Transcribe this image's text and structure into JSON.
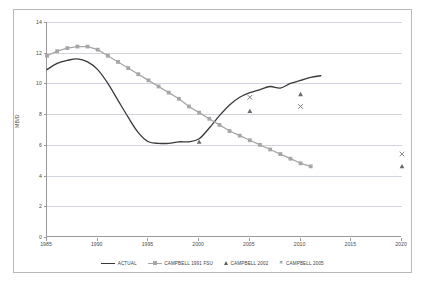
{
  "chart_data": {
    "type": "line",
    "title": "",
    "xlabel": "",
    "ylabel": "MB/D",
    "xlim": [
      1985,
      2020
    ],
    "ylim": [
      0,
      14
    ],
    "xticks": [
      1985,
      1990,
      1995,
      2000,
      2005,
      2010,
      2015,
      2020
    ],
    "yticks": [
      0,
      2,
      4,
      6,
      8,
      10,
      12,
      14
    ],
    "grid": true,
    "legend_position": "bottom",
    "series": [
      {
        "name": "ACTUAL",
        "type": "line",
        "color": "#3a3a3a",
        "marker": "none",
        "x": [
          1985,
          1986,
          1987,
          1988,
          1989,
          1990,
          1991,
          1992,
          1993,
          1994,
          1995,
          1996,
          1997,
          1998,
          1999,
          2000,
          2001,
          2002,
          2003,
          2004,
          2005,
          2006,
          2007,
          2008,
          2009,
          2010,
          2011,
          2012
        ],
        "values": [
          10.9,
          11.3,
          11.5,
          11.6,
          11.4,
          10.9,
          10.0,
          8.9,
          7.8,
          6.8,
          6.2,
          6.1,
          6.1,
          6.2,
          6.2,
          6.4,
          7.1,
          7.9,
          8.6,
          9.1,
          9.4,
          9.6,
          9.8,
          9.7,
          10.0,
          10.2,
          10.4,
          10.5
        ]
      },
      {
        "name": "CAMPBELL 1991 FSU",
        "type": "line",
        "color": "#a6a6a6",
        "marker": "square",
        "x": [
          1985,
          1986,
          1987,
          1988,
          1989,
          1990,
          1991,
          1992,
          1993,
          1994,
          1995,
          1996,
          1997,
          1998,
          1999,
          2000,
          2001,
          2002,
          2003,
          2004,
          2005,
          2006,
          2007,
          2008,
          2009,
          2010,
          2011
        ],
        "values": [
          11.8,
          12.1,
          12.3,
          12.4,
          12.4,
          12.2,
          11.8,
          11.4,
          11.0,
          10.6,
          10.2,
          9.8,
          9.4,
          9.0,
          8.5,
          8.1,
          7.7,
          7.3,
          6.9,
          6.6,
          6.3,
          6.0,
          5.7,
          5.4,
          5.1,
          4.8,
          4.6
        ]
      },
      {
        "name": "CAMPBELL 2002",
        "type": "scatter",
        "color": "#6a6a6a",
        "marker": "triangle",
        "x": [
          2000,
          2005,
          2010,
          2020
        ],
        "values": [
          6.2,
          8.2,
          9.3,
          4.6
        ]
      },
      {
        "name": "CAMPBELL 2005",
        "type": "scatter",
        "color": "#6a6a6a",
        "marker": "x",
        "x": [
          2005,
          2010,
          2020
        ],
        "values": [
          9.1,
          8.5,
          5.4
        ]
      }
    ]
  },
  "axis": {
    "y_title": "MB/D",
    "y_tick_labels": [
      "0",
      "2",
      "4",
      "6",
      "8",
      "10",
      "12",
      "14"
    ],
    "x_tick_labels": [
      "1985",
      "1990",
      "1995",
      "2000",
      "2005",
      "2010",
      "2015",
      "2020"
    ]
  },
  "legend": {
    "items": [
      {
        "label": "ACTUAL",
        "marker": "line"
      },
      {
        "label": "CAMPBELL 1991 FSU",
        "marker": "line-square"
      },
      {
        "label": "CAMPBELL 2002",
        "marker": "triangle"
      },
      {
        "label": "CAMPBELL 2005",
        "marker": "x"
      }
    ]
  }
}
